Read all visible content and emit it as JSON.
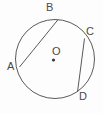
{
  "figure": {
    "background_color": "#fdfdfd",
    "stroke_color": "#5a5a5a",
    "label_color": "#4a4a4a",
    "circle": {
      "center_x": 55,
      "center_y": 59,
      "radius": 39.5
    },
    "center_point": {
      "name": "O",
      "label": "O",
      "label_x": 52,
      "label_y": 46,
      "dot_x": 53.5,
      "dot_y": 60,
      "dot_radius": 1.6
    },
    "points": [
      {
        "name": "A",
        "label": "A",
        "x": 19.5,
        "y": 67.0,
        "label_x": 7,
        "label_y": 61
      },
      {
        "name": "B",
        "label": "B",
        "x": 58.0,
        "y": 19.7,
        "label_x": 46,
        "label_y": 2
      },
      {
        "name": "C",
        "label": "C",
        "x": 84.5,
        "y": 38.5,
        "label_x": 86,
        "label_y": 26
      },
      {
        "name": "D",
        "label": "D",
        "x": 77.5,
        "y": 92.0,
        "label_x": 79,
        "label_y": 91
      }
    ],
    "chords": [
      {
        "name": "chord-AB",
        "from": "A",
        "to": "B",
        "x1": 19.5,
        "y1": 67.0,
        "x2": 58.0,
        "y2": 19.7
      },
      {
        "name": "chord-CD",
        "from": "C",
        "to": "D",
        "x1": 84.5,
        "y1": 38.5,
        "x2": 77.5,
        "y2": 92.0
      }
    ]
  }
}
